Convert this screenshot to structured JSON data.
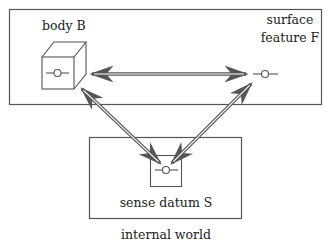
{
  "diagram": {
    "colors": {
      "stroke": "#555555",
      "text": "#222222",
      "background": "#ffffff"
    },
    "external_box": {
      "body_label": "body B",
      "feature_label_line1": "surface",
      "feature_label_line2": "feature F"
    },
    "internal_box": {
      "datum_label": "sense datum S",
      "world_label": "internal world"
    },
    "arrows": [
      {
        "from": "body B",
        "to": "surface feature F",
        "style": "double-line, bidirectional"
      },
      {
        "from": "sense datum S",
        "to": "body B",
        "style": "double-line, bidirectional"
      },
      {
        "from": "sense datum S",
        "to": "surface feature F",
        "style": "double-line, bidirectional"
      }
    ]
  }
}
